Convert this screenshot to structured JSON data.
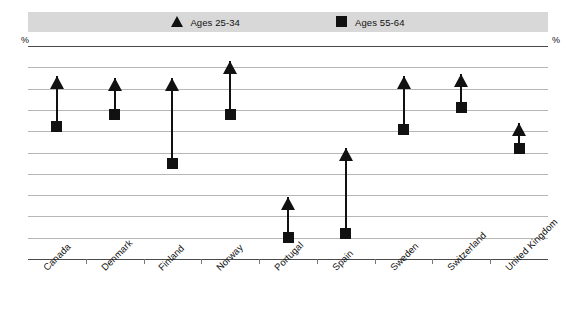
{
  "legend": {
    "entries": [
      {
        "label": "Ages 25-34",
        "marker": "triangle-icon",
        "color": "#111111"
      },
      {
        "label": "Ages 55-64",
        "marker": "square-icon",
        "color": "#111111"
      }
    ],
    "background_color": "#d8d8d8"
  },
  "axis": {
    "unit_left": "%",
    "unit_right": "%",
    "ticks": [
      100,
      90,
      80,
      70,
      60,
      50,
      40,
      30,
      20,
      10,
      0
    ]
  },
  "chart_data": {
    "type": "scatter",
    "title": "",
    "subtitle": "",
    "xlabel": "",
    "ylabel": "%",
    "ylim": [
      0,
      100
    ],
    "ytick_step": 10,
    "grid": true,
    "legend_position": "top",
    "categories": [
      "Canada",
      "Denmark",
      "Finland",
      "Norway",
      "Portugal",
      "Spain",
      "Sweden",
      "Switzerland",
      "United Kingdom"
    ],
    "series": [
      {
        "name": "Ages 25-34",
        "marker": "triangle",
        "color": "#111111",
        "values": [
          86,
          85,
          85,
          93,
          29,
          52,
          86,
          87,
          64
        ]
      },
      {
        "name": "Ages 55-64",
        "marker": "square",
        "color": "#111111",
        "values": [
          62,
          68,
          45,
          68,
          10,
          12,
          61,
          71,
          52
        ]
      }
    ]
  }
}
